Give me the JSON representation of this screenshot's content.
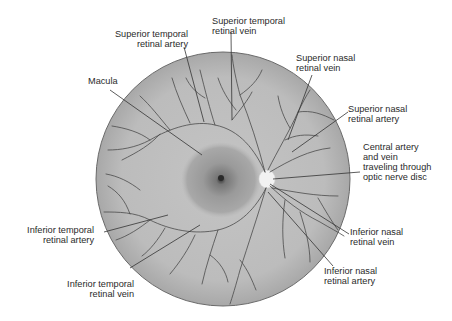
{
  "diagram": {
    "labels": {
      "superior_temporal_artery": [
        "Superior temporal",
        "retinal artery"
      ],
      "superior_temporal_vein": [
        "Superior temporal",
        "retinal vein"
      ],
      "superior_nasal_vein": [
        "Superior nasal",
        "retinal vein"
      ],
      "superior_nasal_artery": [
        "Superior nasal",
        "retinal artery"
      ],
      "macula": [
        "Macula"
      ],
      "central_artery_vein": [
        "Central artery",
        "and vein",
        "traveling through",
        "optic nerve disc"
      ],
      "inferior_nasal_vein": [
        "Inferior nasal",
        "retinal vein"
      ],
      "inferior_nasal_artery": [
        "Inferior nasal",
        "retinal artery"
      ],
      "inferior_temporal_artery": [
        "Inferior temporal",
        "retinal artery"
      ],
      "inferior_temporal_vein": [
        "Inferior temporal",
        "retinal vein"
      ]
    },
    "colors": {
      "fundus": "#bdbdbd",
      "fundus_edge": "#a9a9a9",
      "macula": "#9a9a9a",
      "fovea": "#2b2b2b",
      "optic_disc": "#f2f2f2",
      "vessel": "#4a4a4a",
      "leader": "#333333",
      "outline": "#6a6a6a"
    }
  }
}
